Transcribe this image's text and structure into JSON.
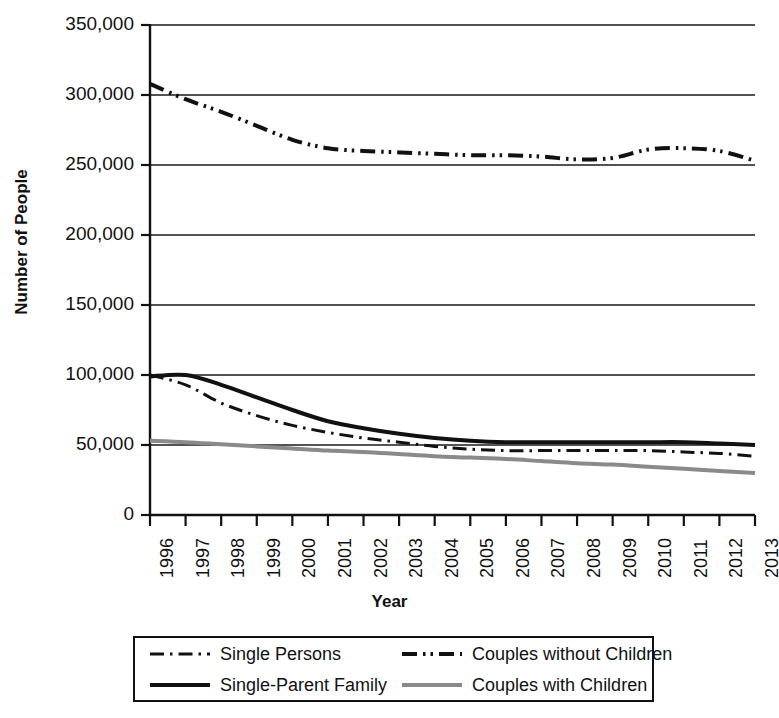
{
  "chart_data": {
    "type": "line",
    "title": "",
    "xlabel": "Year",
    "ylabel": "Number of People",
    "grid": true,
    "legend_position": "bottom",
    "x": [
      1996,
      1997,
      1998,
      1999,
      2000,
      2001,
      2002,
      2003,
      2004,
      2005,
      2006,
      2007,
      2008,
      2009,
      2010,
      2011,
      2012,
      2013
    ],
    "xtick_labels": [
      "1996",
      "1997",
      "1998",
      "1999",
      "2000",
      "2001",
      "2002",
      "2003",
      "2004",
      "2005",
      "2006",
      "2007",
      "2008",
      "2009",
      "2010",
      "2011",
      "2012",
      "2013"
    ],
    "ytick_labels": [
      "350,000",
      "300,000",
      "250,000",
      "200,000",
      "150,000",
      "100,000",
      "50,000",
      "0"
    ],
    "ytick_values": [
      350000,
      300000,
      250000,
      200000,
      150000,
      100000,
      50000,
      0
    ],
    "ylim": [
      0,
      350000
    ],
    "xlim": [
      1996,
      2013
    ],
    "series": [
      {
        "name": "Single Persons",
        "style": "dash-dot",
        "color": "#111111",
        "width": 3,
        "values": [
          100000,
          93000,
          80000,
          71000,
          64000,
          59000,
          55000,
          52000,
          49000,
          47000,
          46000,
          46000,
          46000,
          46000,
          46000,
          45000,
          44000,
          42000
        ]
      },
      {
        "name": "Couples without Children",
        "style": "dash-dot-dot",
        "color": "#111111",
        "width": 4,
        "values": [
          308000,
          297000,
          288000,
          278000,
          268000,
          262000,
          260000,
          259000,
          258000,
          257000,
          257000,
          256000,
          254000,
          255000,
          261000,
          262000,
          260000,
          253000
        ]
      },
      {
        "name": "Single-Parent Family",
        "style": "solid",
        "color": "#111111",
        "width": 4,
        "values": [
          99000,
          100000,
          93000,
          84000,
          75000,
          67000,
          62000,
          58000,
          55000,
          53000,
          52000,
          52000,
          52000,
          52000,
          52000,
          52000,
          51000,
          50000
        ]
      },
      {
        "name": "Couples with Children",
        "style": "solid-gray",
        "color": "#8a8a8a",
        "width": 4,
        "values": [
          53000,
          52000,
          50500,
          49000,
          47500,
          46000,
          45000,
          43500,
          42000,
          41000,
          40000,
          38500,
          37000,
          36000,
          34500,
          33000,
          31500,
          30000
        ]
      }
    ]
  },
  "legend": {
    "items": [
      {
        "label": "Single Persons",
        "swatch": "dash-dot-swatch"
      },
      {
        "label": "Couples without Children",
        "swatch": "dash-dot-dot-swatch"
      },
      {
        "label": "Single-Parent Family",
        "swatch": "solid-swatch"
      },
      {
        "label": "Couples with Children",
        "swatch": "solid-gray-swatch"
      }
    ]
  },
  "axes": {
    "y_title": "Number of People",
    "x_title": "Year"
  }
}
